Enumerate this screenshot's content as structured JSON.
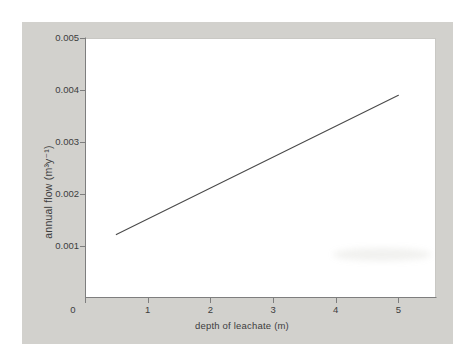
{
  "figure": {
    "kind": "scanned-textbook-chart",
    "page_background": "#ffffff",
    "panel_background": "#d2d1cd"
  },
  "chart_data": {
    "type": "line",
    "title": "",
    "xlabel": "depth of leachate (m)",
    "ylabel": "annual flow (m³y⁻¹)",
    "xlim": [
      0,
      5.6
    ],
    "ylim": [
      0,
      0.005
    ],
    "x_ticks": [
      0,
      1,
      2,
      3,
      4,
      5
    ],
    "x_tick_labels": [
      "0",
      "1",
      "2",
      "3",
      "4",
      "5"
    ],
    "y_ticks": [
      0.001,
      0.002,
      0.003,
      0.004,
      0.005
    ],
    "y_tick_labels": [
      "0.001",
      "0.002",
      "0.003",
      "0.004",
      "0.005"
    ],
    "grid": false,
    "legend": false,
    "axis_color": "#7e7e7e",
    "text_color": "#3d3d3d",
    "series": [
      {
        "name": "annual flow vs depth of leachate",
        "color": "#4a4a4a",
        "points": [
          [
            0.5,
            0.00122
          ],
          [
            5.0,
            0.0039
          ]
        ]
      }
    ]
  }
}
